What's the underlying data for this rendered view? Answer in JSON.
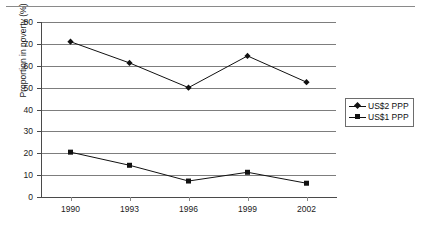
{
  "chart_data": {
    "type": "line",
    "title": "",
    "xlabel": "",
    "ylabel": "Proportion in poverty (%)",
    "categories": [
      "1990",
      "1993",
      "1996",
      "1999",
      "2002"
    ],
    "ylim": [
      0,
      80
    ],
    "yticks": [
      "0",
      "10",
      "20",
      "30",
      "40",
      "50",
      "60",
      "70",
      "80"
    ],
    "grid": "horizontal",
    "legend_position": "right",
    "series": [
      {
        "name": "US$2 PPP",
        "marker": "diamond",
        "color": "#111111",
        "values": [
          71,
          61.3,
          50,
          64.5,
          52.5
        ]
      },
      {
        "name": "US$1 PPP",
        "marker": "square",
        "color": "#111111",
        "values": [
          20.5,
          14.5,
          7.3,
          11.3,
          6.3
        ]
      }
    ]
  },
  "legend": {
    "entries": [
      {
        "label": "US$2 PPP"
      },
      {
        "label": "US$1 PPP"
      }
    ]
  },
  "axis": {
    "y_label": "Proportion in poverty (%)",
    "y_ticks": [
      "80",
      "70",
      "60",
      "50",
      "40",
      "30",
      "20",
      "10",
      "0"
    ],
    "x_ticks": [
      "1990",
      "1993",
      "1996",
      "1999",
      "2002"
    ]
  }
}
